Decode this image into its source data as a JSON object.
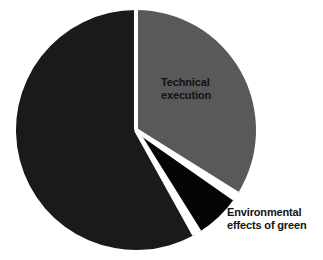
{
  "chart_data": {
    "type": "pie",
    "title": "",
    "subtitle": "",
    "xlabel": "",
    "ylabel": "",
    "legend_position": "none",
    "grid": false,
    "labels_inside": true,
    "categories": [
      "Technical execution",
      "Environmental effects of green",
      "Green-reading ability"
    ],
    "values": [
      34,
      6,
      60
    ],
    "units": "percent",
    "slices": [
      {
        "name": "technical-execution",
        "label": "Technical\nexecution",
        "label_text": "Technical execution",
        "value": 34,
        "start_angle": 0,
        "end_angle": 122,
        "color": "#59595a",
        "label_color": "#111214"
      },
      {
        "name": "environmental-effects-of-green",
        "label": "Environmental\neffects of green",
        "label_text": "Environmental effects of green",
        "value": 6,
        "start_angle": 125,
        "end_angle": 148,
        "color": "#050506",
        "label_color": "#111214"
      },
      {
        "name": "green-reading-ability",
        "label": "Green-reading\nability",
        "label_text": "Green-reading ability",
        "value": 60,
        "start_angle": 151,
        "end_angle": 360,
        "color": "#1a1a1c",
        "label_color": "#1a1a1c"
      }
    ],
    "geometry": {
      "center_x": 136,
      "center_y": 130,
      "radius": 120,
      "separator_color": "#ffffff",
      "separator_width": 4
    },
    "colors": {
      "background": "#ffffff",
      "gray_slice": "#59595a",
      "black_wedge": "#050506",
      "dark_slice": "#1a1a1c"
    }
  }
}
